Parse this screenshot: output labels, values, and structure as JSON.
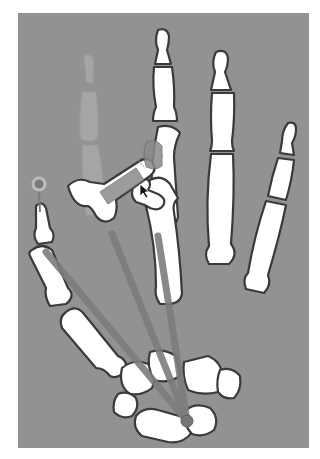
{
  "figure": {
    "title": "",
    "width": 320,
    "height": 459,
    "background_color": "#ffffff",
    "panel_color": "#8c8c8c",
    "bone_fill": "#ffffff",
    "bone_outline": "#3a3a3a",
    "ik_line_color": "#7c7c7c"
  },
  "elements": {
    "ghost_index_finger": {
      "label": "original index finger position (ghosted)"
    },
    "selected_bone": {
      "label": "rotated index metacarpal (selected)"
    },
    "ik_handle": {
      "label": "thumb IK handle",
      "cx": 39,
      "cy": 184,
      "r": 6
    },
    "pivot": {
      "label": "wrist pivot",
      "cx": 187,
      "cy": 421,
      "r": 6
    },
    "cursor": {
      "label": "mouse cursor",
      "x": 143,
      "y": 188
    }
  }
}
